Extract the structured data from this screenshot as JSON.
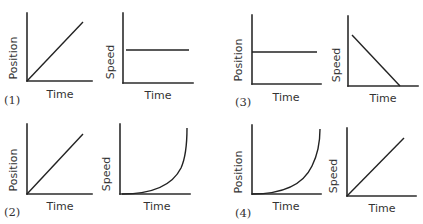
{
  "figure": {
    "colors": {
      "line": "#222222",
      "axis": "#2b2b2b",
      "text": "#333333",
      "background": "#ffffff"
    }
  },
  "panels": [
    {
      "number": "(1)",
      "position_graph": {
        "ylabel": "Position",
        "xlabel": "Time",
        "shape": "straight line rising from origin"
      },
      "speed_graph": {
        "ylabel": "Speed",
        "xlabel": "Time",
        "shape": "horizontal constant line"
      }
    },
    {
      "number": "(2)",
      "position_graph": {
        "ylabel": "Position",
        "xlabel": "Time",
        "shape": "straight line rising from origin"
      },
      "speed_graph": {
        "ylabel": "Speed",
        "xlabel": "Time",
        "shape": "curve increasing at increasing rate"
      }
    },
    {
      "number": "(3)",
      "position_graph": {
        "ylabel": "Position",
        "xlabel": "Time",
        "shape": "horizontal constant line"
      },
      "speed_graph": {
        "ylabel": "Speed",
        "xlabel": "Time",
        "shape": "straight line decreasing to zero"
      }
    },
    {
      "number": "(4)",
      "position_graph": {
        "ylabel": "Position",
        "xlabel": "Time",
        "shape": "curve increasing at increasing rate"
      },
      "speed_graph": {
        "ylabel": "Speed",
        "xlabel": "Time",
        "shape": "straight line rising from origin"
      }
    }
  ]
}
